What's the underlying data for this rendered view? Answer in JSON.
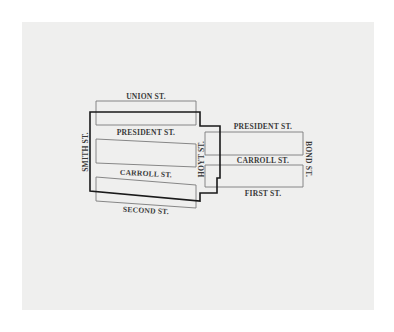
{
  "map": {
    "colors": {
      "background": "#ffffff",
      "panel": "#efefee",
      "block_outline": "#7a7a7a",
      "boundary": "#1a1a1a",
      "label": "#3a3a3a"
    },
    "streets": {
      "union": "UNION ST.",
      "president_left": "PRESIDENT ST.",
      "carroll_left": "CARROLL ST.",
      "second": "SECOND ST.",
      "smith": "SMITH ST.",
      "hoyt": "HOYT ST.",
      "president_right": "PRESIDENT ST.",
      "carroll_right": "CARROLL ST.",
      "first": "FIRST ST.",
      "bond": "BOND ST."
    }
  }
}
